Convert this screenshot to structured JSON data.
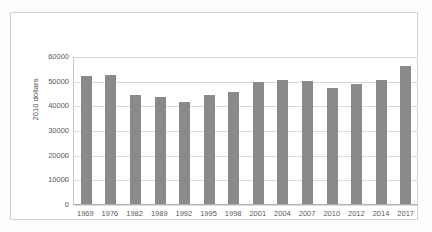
{
  "chart_data": {
    "type": "bar",
    "title": "",
    "xlabel": "",
    "ylabel": "2010 dollars",
    "categories": [
      "1969",
      "1976",
      "1982",
      "1989",
      "1992",
      "1995",
      "1998",
      "2001",
      "2004",
      "2007",
      "2010",
      "2012",
      "2014",
      "2017"
    ],
    "values": [
      52000,
      52400,
      44000,
      43300,
      41200,
      44100,
      45300,
      49400,
      50200,
      49900,
      46900,
      48600,
      50200,
      56000
    ],
    "ylim": [
      0,
      60000
    ],
    "yticks": [
      0,
      10000,
      20000,
      30000,
      40000,
      50000,
      60000
    ],
    "ytick_labels": [
      "0",
      "10000",
      "20000",
      "30000",
      "40000",
      "50000",
      "60000"
    ],
    "grid": true,
    "legend": false,
    "legend_position": "none",
    "series": [
      {
        "name": "2010 dollars",
        "color": "#8a8a8a",
        "values": [
          52000,
          52400,
          44000,
          43300,
          41200,
          44100,
          45300,
          49400,
          50200,
          49900,
          46900,
          48600,
          50200,
          56000
        ]
      }
    ]
  },
  "colors": {
    "bar": "#8a8a8a",
    "gridline": "#d9d9d9",
    "axis": "#b4b4b4",
    "frame": "#d2d2d2",
    "text": "#595959",
    "background": "#ffffff"
  }
}
